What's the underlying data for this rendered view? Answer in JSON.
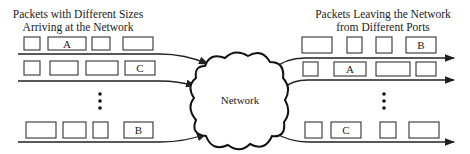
{
  "left_caption": [
    "Packets with Different Sizes",
    "Arriving at the Network"
  ],
  "right_caption": [
    "Packets Leaving the Network",
    "from Different Ports"
  ],
  "network_label": "Network",
  "left_rows": [
    {
      "y": 37,
      "h": 13,
      "line_y": 54,
      "boxes": [
        {
          "x": 24,
          "w": 16,
          "label": ""
        },
        {
          "x": 48,
          "w": 38,
          "label": "A"
        },
        {
          "x": 92,
          "w": 18,
          "label": ""
        },
        {
          "x": 123,
          "w": 30,
          "label": ""
        }
      ]
    },
    {
      "y": 61,
      "h": 14,
      "line_y": 81,
      "boxes": [
        {
          "x": 24,
          "w": 16,
          "label": ""
        },
        {
          "x": 50,
          "w": 28,
          "label": ""
        },
        {
          "x": 86,
          "w": 32,
          "label": ""
        },
        {
          "x": 125,
          "w": 30,
          "label": "C"
        }
      ]
    },
    {
      "y": 122,
      "h": 16,
      "line_y": 142,
      "boxes": [
        {
          "x": 26,
          "w": 30,
          "label": ""
        },
        {
          "x": 63,
          "w": 23,
          "label": ""
        },
        {
          "x": 93,
          "w": 15,
          "label": ""
        },
        {
          "x": 124,
          "w": 29,
          "label": "B"
        }
      ]
    }
  ],
  "right_rows": [
    {
      "y": 37,
      "h": 16,
      "line_y": 58,
      "boxes": [
        {
          "x": 302,
          "w": 30,
          "label": ""
        },
        {
          "x": 347,
          "w": 15,
          "label": ""
        },
        {
          "x": 376,
          "w": 16,
          "label": ""
        },
        {
          "x": 406,
          "w": 30,
          "label": "B"
        }
      ]
    },
    {
      "y": 62,
      "h": 14,
      "line_y": 80,
      "boxes": [
        {
          "x": 303,
          "w": 15,
          "label": ""
        },
        {
          "x": 334,
          "w": 32,
          "label": "A"
        },
        {
          "x": 376,
          "w": 34,
          "label": ""
        },
        {
          "x": 416,
          "w": 20,
          "label": ""
        }
      ]
    },
    {
      "y": 122,
      "h": 16,
      "line_y": 142,
      "boxes": [
        {
          "x": 305,
          "w": 17,
          "label": ""
        },
        {
          "x": 331,
          "w": 30,
          "label": "C"
        },
        {
          "x": 380,
          "w": 16,
          "label": ""
        },
        {
          "x": 409,
          "w": 30,
          "label": ""
        }
      ]
    }
  ],
  "ellipsis_left": {
    "x": 100,
    "ys": [
      94,
      101,
      108
    ]
  },
  "ellipsis_right": {
    "x": 384,
    "ys": [
      94,
      101,
      108
    ]
  }
}
